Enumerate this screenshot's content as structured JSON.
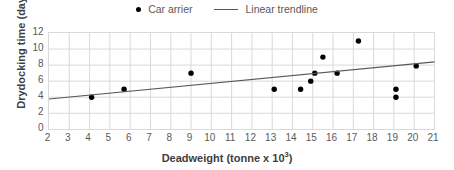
{
  "chart_data": {
    "type": "scatter",
    "title": "",
    "xlabel": "Deadweight (tonne x 10³)",
    "ylabel": "Drydocking time (day)",
    "xlim": [
      2,
      21
    ],
    "ylim": [
      0,
      12
    ],
    "xticks": [
      2,
      3,
      4,
      5,
      6,
      7,
      8,
      9,
      10,
      11,
      12,
      13,
      14,
      15,
      16,
      17,
      18,
      19,
      20,
      21
    ],
    "yticks": [
      0,
      2,
      4,
      6,
      8,
      10,
      12
    ],
    "grid": true,
    "legend_position": "top-center",
    "series": [
      {
        "name": "Car arrier",
        "type": "scatter",
        "marker": "circle",
        "color": "#000000",
        "points": [
          {
            "x": 4.1,
            "y": 4.0
          },
          {
            "x": 5.7,
            "y": 5.0
          },
          {
            "x": 9.0,
            "y": 7.0
          },
          {
            "x": 13.1,
            "y": 5.0
          },
          {
            "x": 14.4,
            "y": 5.0
          },
          {
            "x": 14.9,
            "y": 6.0
          },
          {
            "x": 15.1,
            "y": 7.0
          },
          {
            "x": 15.5,
            "y": 9.0
          },
          {
            "x": 16.2,
            "y": 7.0
          },
          {
            "x": 17.25,
            "y": 11.0
          },
          {
            "x": 19.1,
            "y": 5.0
          },
          {
            "x": 19.1,
            "y": 4.0
          },
          {
            "x": 20.1,
            "y": 7.9
          }
        ]
      },
      {
        "name": "Linear trendline",
        "type": "line",
        "color": "#595959",
        "points": [
          {
            "x": 2,
            "y": 3.77
          },
          {
            "x": 21,
            "y": 8.4
          }
        ]
      }
    ]
  },
  "legend": {
    "entries": [
      {
        "label": "Car arrier",
        "marker": "dot"
      },
      {
        "label": "Linear trendline",
        "marker": "line"
      }
    ]
  },
  "axes": {
    "x_title": "Deadweight (tonne x 10",
    "x_title_sup": "3",
    "x_title_tail": ")",
    "y_title": "Drydocking time (day)"
  },
  "colors": {
    "marker": "#000000",
    "trendline": "#595959",
    "grid": "#d9d9d9",
    "tick_text": "#595959",
    "axis_title": "#404040",
    "background": "#ffffff"
  }
}
